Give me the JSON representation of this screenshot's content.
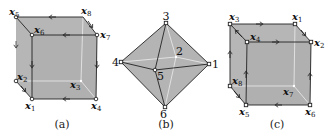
{
  "colors": {
    "face_fill": "#b8b8b8",
    "front_fill": "#b0b0b0",
    "edge": "#222222",
    "hidden_edge": "#e8e8e8",
    "vertex_fill": "#ffffff"
  },
  "panels": [
    {
      "id": "a",
      "caption": "(a)",
      "type": "cube",
      "vertices": [
        {
          "name": "x1",
          "label": "x",
          "sub": "1"
        },
        {
          "name": "x2",
          "label": "x",
          "sub": "2"
        },
        {
          "name": "x3",
          "label": "x",
          "sub": "3"
        },
        {
          "name": "x4",
          "label": "x",
          "sub": "4"
        },
        {
          "name": "x5",
          "label": "x",
          "sub": "5"
        },
        {
          "name": "x6",
          "label": "x",
          "sub": "6"
        },
        {
          "name": "x7",
          "label": "x",
          "sub": "7"
        },
        {
          "name": "x8",
          "label": "x",
          "sub": "8"
        }
      ]
    },
    {
      "id": "b",
      "caption": "(b)",
      "type": "octahedron",
      "vertices": [
        {
          "name": "1",
          "label": "1"
        },
        {
          "name": "2",
          "label": "2"
        },
        {
          "name": "3",
          "label": "3"
        },
        {
          "name": "4",
          "label": "4"
        },
        {
          "name": "5",
          "label": "5"
        },
        {
          "name": "6",
          "label": "6"
        }
      ]
    },
    {
      "id": "c",
      "caption": "(c)",
      "type": "cube",
      "vertices": [
        {
          "name": "x1",
          "label": "x",
          "sub": "1"
        },
        {
          "name": "x2",
          "label": "x",
          "sub": "2"
        },
        {
          "name": "x3",
          "label": "x",
          "sub": "3"
        },
        {
          "name": "x4",
          "label": "x",
          "sub": "4"
        },
        {
          "name": "x5",
          "label": "x",
          "sub": "5"
        },
        {
          "name": "x6",
          "label": "x",
          "sub": "6"
        },
        {
          "name": "x7",
          "label": "x",
          "sub": "7"
        },
        {
          "name": "x8",
          "label": "x",
          "sub": "8"
        }
      ]
    }
  ]
}
